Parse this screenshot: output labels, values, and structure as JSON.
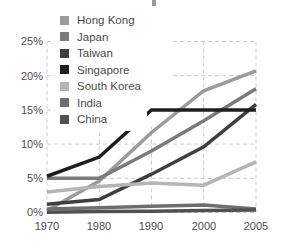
{
  "chart_data": {
    "type": "line",
    "title": "",
    "xlabel": "",
    "ylabel": "",
    "x_categories": [
      "1970",
      "1980",
      "1990",
      "2000",
      "2005"
    ],
    "ylim": [
      0,
      25
    ],
    "ytick_labels": [
      "0%",
      "5%",
      "10%",
      "15%",
      "20%",
      "25%"
    ],
    "grid": "dashed",
    "legend_position": "top-left",
    "series": [
      {
        "name": "Hong Kong",
        "color": "#9b9b9b",
        "values": [
          0.3,
          4.6,
          11.7,
          17.8,
          20.7
        ]
      },
      {
        "name": "Japan",
        "color": "#7a7a7a",
        "values": [
          5.0,
          5.0,
          9.0,
          13.4,
          18.1
        ]
      },
      {
        "name": "Taiwan",
        "color": "#3f3f3f",
        "values": [
          1.2,
          1.9,
          5.6,
          9.6,
          15.8
        ]
      },
      {
        "name": "Singapore",
        "color": "#1e1e1e",
        "values": [
          5.3,
          8.1,
          15.0,
          15.0,
          15.0
        ]
      },
      {
        "name": "South Korea",
        "color": "#b5b5b5",
        "values": [
          3.0,
          3.8,
          4.3,
          4.0,
          7.4
        ]
      },
      {
        "name": "India",
        "color": "#6e6e6e",
        "values": [
          0.5,
          0.7,
          0.9,
          1.1,
          0.5
        ]
      },
      {
        "name": "China",
        "color": "#505050",
        "values": [
          0.05,
          0.15,
          0.2,
          0.3,
          0.35
        ]
      }
    ]
  },
  "colors": {
    "grid": "#cbcbcb",
    "tick_text": "#4d4d4d",
    "legend_text": "#4a4a4a",
    "background": "#ffffff"
  }
}
